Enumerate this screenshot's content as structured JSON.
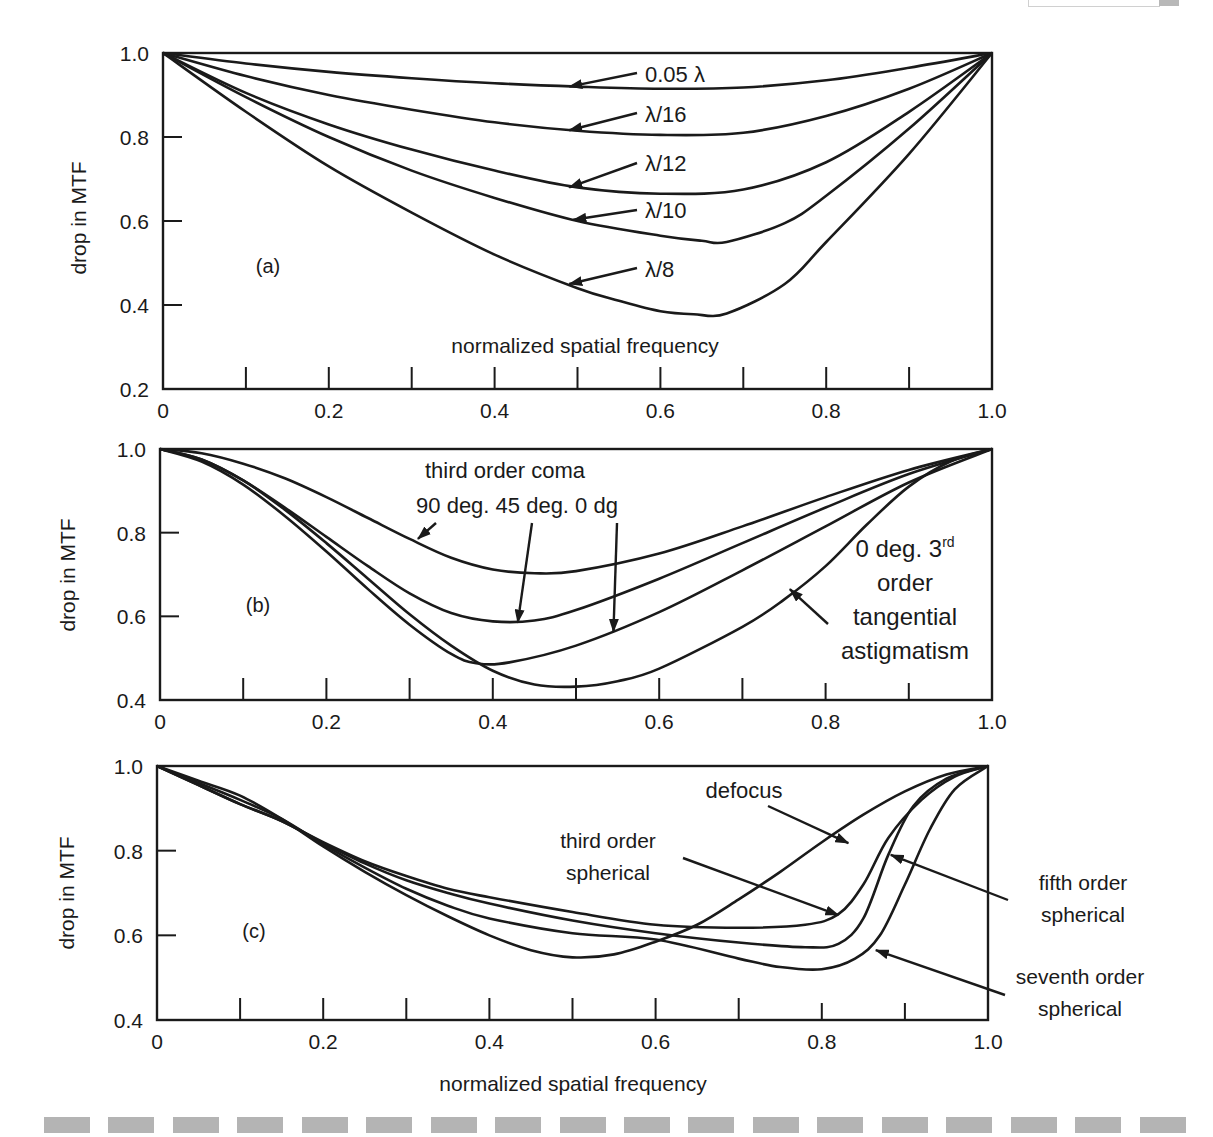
{
  "figure": {
    "corner_box": true,
    "dash_bar_segments": 18
  },
  "chart_data": [
    {
      "id": "a",
      "type": "line",
      "panel_label": "(a)",
      "title": "",
      "xlabel": "normalized spatial frequency",
      "ylabel": "drop in MTF",
      "xlim": [
        0,
        1.0
      ],
      "ylim": [
        0.2,
        1.0
      ],
      "x_tick_labels": [
        "0",
        "0.2",
        "0.4",
        "0.6",
        "0.8",
        "1.0"
      ],
      "x_ticks": [
        0,
        0.2,
        0.4,
        0.6,
        0.8,
        1.0
      ],
      "x_minor_ticks": [
        0.1,
        0.2,
        0.3,
        0.4,
        0.5,
        0.6,
        0.7,
        0.8,
        0.9
      ],
      "y_tick_labels": [
        "1.0",
        "0.8",
        "0.6",
        "0.4",
        "0.2"
      ],
      "y_ticks": [
        1.0,
        0.8,
        0.6,
        0.4,
        0.2
      ],
      "grid": false,
      "pixel_box": {
        "x0": 163,
        "x1": 992,
        "y_top": 53,
        "y_bottom": 389
      },
      "xlabel_pos": {
        "x": 585,
        "y": 353
      },
      "ylabel_pos": {
        "x": 86,
        "y": 218
      },
      "panel_label_pos": {
        "x": 268,
        "y": 273
      },
      "series": [
        {
          "name": "0.05 λ",
          "x": [
            0,
            0.1,
            0.2,
            0.3,
            0.4,
            0.5,
            0.6,
            0.7,
            0.8,
            0.9,
            1.0
          ],
          "y": [
            1.0,
            0.975,
            0.955,
            0.94,
            0.928,
            0.92,
            0.915,
            0.918,
            0.935,
            0.965,
            1.0
          ]
        },
        {
          "name": "λ/16",
          "x": [
            0,
            0.1,
            0.2,
            0.3,
            0.4,
            0.5,
            0.6,
            0.7,
            0.8,
            0.9,
            1.0
          ],
          "y": [
            1.0,
            0.945,
            0.9,
            0.865,
            0.835,
            0.815,
            0.805,
            0.81,
            0.85,
            0.915,
            1.0
          ]
        },
        {
          "name": "λ/12",
          "x": [
            0,
            0.1,
            0.2,
            0.3,
            0.4,
            0.5,
            0.6,
            0.7,
            0.8,
            0.9,
            1.0
          ],
          "y": [
            1.0,
            0.905,
            0.83,
            0.77,
            0.72,
            0.68,
            0.665,
            0.675,
            0.74,
            0.86,
            1.0
          ]
        },
        {
          "name": "λ/10",
          "x": [
            0,
            0.1,
            0.2,
            0.3,
            0.4,
            0.5,
            0.6,
            0.65,
            0.68,
            0.75,
            0.8,
            0.9,
            1.0
          ],
          "y": [
            1.0,
            0.895,
            0.8,
            0.72,
            0.655,
            0.6,
            0.565,
            0.553,
            0.55,
            0.595,
            0.66,
            0.82,
            1.0
          ]
        },
        {
          "name": "λ/8",
          "x": [
            0,
            0.1,
            0.2,
            0.3,
            0.4,
            0.5,
            0.55,
            0.6,
            0.64,
            0.68,
            0.75,
            0.8,
            0.9,
            1.0
          ],
          "y": [
            1.0,
            0.86,
            0.73,
            0.62,
            0.52,
            0.44,
            0.41,
            0.385,
            0.378,
            0.38,
            0.45,
            0.55,
            0.76,
            1.0
          ]
        }
      ],
      "annotations": [
        {
          "text": "0.05 λ",
          "text_x": 645,
          "text_y": 82,
          "arrow_from": [
            637,
            73
          ],
          "arrow_to": [
            0.49,
            0.92
          ]
        },
        {
          "text": "λ/16",
          "text_x": 645,
          "text_y": 122,
          "arrow_from": [
            637,
            113
          ],
          "arrow_to": [
            0.49,
            0.816
          ]
        },
        {
          "text": "λ/12",
          "text_x": 645,
          "text_y": 171,
          "arrow_from": [
            637,
            163
          ],
          "arrow_to": [
            0.49,
            0.68
          ]
        },
        {
          "text": "λ/10",
          "text_x": 645,
          "text_y": 218,
          "arrow_from": [
            637,
            210
          ],
          "arrow_to": [
            0.495,
            0.603
          ]
        },
        {
          "text": "λ/8",
          "text_x": 645,
          "text_y": 277,
          "arrow_from": [
            637,
            268
          ],
          "arrow_to": [
            0.49,
            0.45
          ]
        }
      ]
    },
    {
      "id": "b",
      "type": "line",
      "panel_label": "(b)",
      "title": "third order coma",
      "xlabel": "",
      "ylabel": "drop in MTF",
      "xlim": [
        0,
        1.0
      ],
      "ylim": [
        0.4,
        1.0
      ],
      "x_tick_labels": [
        "0",
        "0.2",
        "0.4",
        "0.6",
        "0.8",
        "1.0"
      ],
      "x_ticks": [
        0,
        0.2,
        0.4,
        0.6,
        0.8,
        1.0
      ],
      "x_minor_ticks": [
        0.1,
        0.2,
        0.3,
        0.4,
        0.5,
        0.6,
        0.7,
        0.8,
        0.9
      ],
      "y_tick_labels": [
        "1.0",
        "0.8",
        "0.6",
        "0.4"
      ],
      "y_ticks": [
        1.0,
        0.8,
        0.6,
        0.4
      ],
      "grid": false,
      "pixel_box": {
        "x0": 160,
        "x1": 992,
        "y_top": 449,
        "y_bottom": 700
      },
      "ylabel_pos": {
        "x": 75,
        "y": 575
      },
      "panel_label_pos": {
        "x": 258,
        "y": 612
      },
      "series": [
        {
          "name": "90 deg.",
          "x": [
            0,
            0.05,
            0.1,
            0.15,
            0.2,
            0.25,
            0.3,
            0.35,
            0.4,
            0.45,
            0.5,
            0.6,
            0.7,
            0.8,
            0.9,
            1.0
          ],
          "y": [
            1.0,
            0.99,
            0.965,
            0.93,
            0.885,
            0.835,
            0.785,
            0.74,
            0.712,
            0.703,
            0.708,
            0.75,
            0.815,
            0.885,
            0.95,
            1.0
          ]
        },
        {
          "name": "45 deg.",
          "x": [
            0,
            0.05,
            0.1,
            0.15,
            0.2,
            0.25,
            0.3,
            0.35,
            0.4,
            0.45,
            0.5,
            0.6,
            0.7,
            0.8,
            0.9,
            1.0
          ],
          "y": [
            1.0,
            0.975,
            0.925,
            0.86,
            0.79,
            0.72,
            0.655,
            0.608,
            0.588,
            0.59,
            0.615,
            0.69,
            0.775,
            0.86,
            0.94,
            1.0
          ]
        },
        {
          "name": "0 dg",
          "x": [
            0,
            0.05,
            0.1,
            0.15,
            0.2,
            0.25,
            0.3,
            0.35,
            0.38,
            0.42,
            0.5,
            0.6,
            0.7,
            0.8,
            0.9,
            1.0
          ],
          "y": [
            1.0,
            0.97,
            0.915,
            0.84,
            0.755,
            0.665,
            0.58,
            0.51,
            0.488,
            0.49,
            0.53,
            0.61,
            0.71,
            0.815,
            0.92,
            1.0
          ]
        },
        {
          "name": "0 deg. 3rd order tangential astigmatism",
          "x": [
            0,
            0.05,
            0.1,
            0.15,
            0.2,
            0.25,
            0.3,
            0.35,
            0.4,
            0.45,
            0.5,
            0.55,
            0.6,
            0.7,
            0.75,
            0.8,
            0.85,
            0.9,
            0.95,
            1.0
          ],
          "y": [
            1.0,
            0.975,
            0.925,
            0.855,
            0.775,
            0.69,
            0.605,
            0.53,
            0.47,
            0.437,
            0.432,
            0.445,
            0.475,
            0.575,
            0.64,
            0.72,
            0.82,
            0.91,
            0.97,
            1.0
          ]
        }
      ],
      "annotations": [
        {
          "text": "third order coma",
          "text_x": 505,
          "text_y": 478,
          "anchor": "middle"
        },
        {
          "text": "90 deg. 45 deg.  0 dg",
          "text_x": 517,
          "text_y": 513,
          "anchor": "middle"
        },
        {
          "text": "",
          "arrow_from": [
            436,
            523
          ],
          "arrow_to": [
            0.31,
            0.785
          ]
        },
        {
          "text": "",
          "arrow_from": [
            532,
            523
          ],
          "arrow_to": [
            0.43,
            0.585
          ]
        },
        {
          "text": "",
          "arrow_from": [
            617,
            523
          ],
          "arrow_to": [
            0.545,
            0.563
          ]
        },
        {
          "text_lines": [
            "0 deg. 3rd",
            "order",
            "tangential",
            "astigmatism"
          ],
          "text_x": 905,
          "text_y": 557,
          "line_height": 34,
          "anchor": "middle",
          "arrow_from": [
            828,
            624
          ],
          "arrow_to": [
            0.757,
            0.665
          ]
        }
      ]
    },
    {
      "id": "c",
      "type": "line",
      "panel_label": "(c)",
      "title": "",
      "xlabel": "normalized spatial frequency",
      "ylabel": "drop in MTF",
      "xlim": [
        0,
        1.0
      ],
      "ylim": [
        0.4,
        1.0
      ],
      "x_tick_labels": [
        "0",
        "0.2",
        "0.4",
        "0.6",
        "0.8",
        "1.0"
      ],
      "x_ticks": [
        0,
        0.2,
        0.4,
        0.6,
        0.8,
        1.0
      ],
      "x_minor_ticks": [
        0.1,
        0.2,
        0.3,
        0.4,
        0.5,
        0.6,
        0.7,
        0.8,
        0.9
      ],
      "y_tick_labels": [
        "1.0",
        "0.8",
        "0.6",
        "0.4"
      ],
      "y_ticks": [
        1.0,
        0.8,
        0.6,
        0.4
      ],
      "grid": false,
      "pixel_box": {
        "x0": 157,
        "x1": 988,
        "y_top": 766,
        "y_bottom": 1020
      },
      "xlabel_pos": {
        "x": 573,
        "y": 1091
      },
      "ylabel_pos": {
        "x": 74,
        "y": 893
      },
      "panel_label_pos": {
        "x": 254,
        "y": 938
      },
      "series": [
        {
          "name": "defocus",
          "x": [
            0,
            0.05,
            0.1,
            0.15,
            0.2,
            0.25,
            0.3,
            0.35,
            0.4,
            0.45,
            0.5,
            0.55,
            0.6,
            0.65,
            0.7,
            0.75,
            0.8,
            0.85,
            0.9,
            0.95,
            1.0
          ],
          "y": [
            1.0,
            0.965,
            0.93,
            0.875,
            0.81,
            0.75,
            0.695,
            0.645,
            0.6,
            0.565,
            0.548,
            0.555,
            0.585,
            0.625,
            0.685,
            0.75,
            0.82,
            0.885,
            0.94,
            0.98,
            1.0
          ]
        },
        {
          "name": "third order spherical",
          "x": [
            0,
            0.05,
            0.1,
            0.15,
            0.2,
            0.25,
            0.3,
            0.35,
            0.4,
            0.5,
            0.6,
            0.7,
            0.78,
            0.82,
            0.85,
            0.88,
            0.92,
            0.96,
            1.0
          ],
          "y": [
            1.0,
            0.955,
            0.91,
            0.87,
            0.82,
            0.775,
            0.74,
            0.71,
            0.69,
            0.655,
            0.625,
            0.618,
            0.625,
            0.65,
            0.72,
            0.83,
            0.92,
            0.975,
            1.0
          ]
        },
        {
          "name": "fifth order spherical",
          "x": [
            0,
            0.05,
            0.1,
            0.15,
            0.2,
            0.25,
            0.3,
            0.35,
            0.4,
            0.5,
            0.6,
            0.7,
            0.78,
            0.82,
            0.85,
            0.88,
            0.91,
            0.95,
            1.0
          ],
          "y": [
            1.0,
            0.955,
            0.91,
            0.87,
            0.818,
            0.77,
            0.73,
            0.7,
            0.675,
            0.635,
            0.605,
            0.583,
            0.572,
            0.58,
            0.64,
            0.79,
            0.905,
            0.97,
            1.0
          ]
        },
        {
          "name": "seventh order spherical",
          "x": [
            0,
            0.05,
            0.1,
            0.15,
            0.2,
            0.25,
            0.3,
            0.35,
            0.4,
            0.5,
            0.6,
            0.7,
            0.75,
            0.8,
            0.84,
            0.87,
            0.9,
            0.93,
            0.96,
            1.0
          ],
          "y": [
            1.0,
            0.96,
            0.92,
            0.875,
            0.815,
            0.76,
            0.71,
            0.67,
            0.64,
            0.605,
            0.59,
            0.545,
            0.525,
            0.52,
            0.545,
            0.6,
            0.72,
            0.85,
            0.945,
            1.0
          ]
        }
      ],
      "annotations": [
        {
          "text": "defocus",
          "text_x": 744,
          "text_y": 798,
          "anchor": "middle",
          "arrow_from": [
            768,
            806
          ],
          "arrow_to": [
            0.832,
            0.818
          ]
        },
        {
          "text_lines": [
            "third order",
            "spherical"
          ],
          "text_x": 608,
          "text_y": 848,
          "line_height": 32,
          "anchor": "middle",
          "arrow_from": [
            683,
            858
          ],
          "arrow_to": [
            0.82,
            0.648
          ]
        },
        {
          "text_lines": [
            "fifth order",
            "spherical"
          ],
          "text_x": 1083,
          "text_y": 890,
          "line_height": 32,
          "anchor": "middle",
          "arrow_from": [
            1008,
            900
          ],
          "arrow_to": [
            0.883,
            0.79
          ]
        },
        {
          "text_lines": [
            "seventh order",
            "spherical"
          ],
          "text_x": 1080,
          "text_y": 984,
          "line_height": 32,
          "anchor": "middle",
          "arrow_from": [
            1005,
            995
          ],
          "arrow_to": [
            0.865,
            0.565
          ]
        }
      ]
    }
  ]
}
